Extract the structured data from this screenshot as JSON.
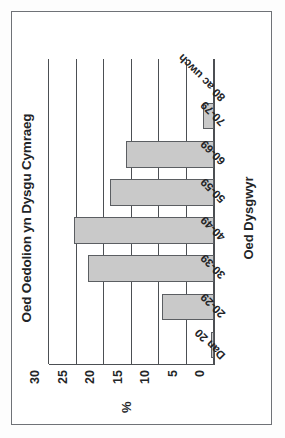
{
  "figure": {
    "frame_color": "#6f7277",
    "background": "#ffffff",
    "rotation_note": "chart printed landscape, scanned portrait"
  },
  "chart_data": {
    "type": "bar",
    "title": "Oed Oedolion yn Dysgu Cymraeg",
    "xlabel": "Oed Dysgwyr",
    "ylabel": "%",
    "categories": [
      "Dan 20",
      "20-29",
      "30-39",
      "40-49",
      "50-59",
      "60-69",
      "70-79",
      "80 ac uwch"
    ],
    "values": [
      0.5,
      9.5,
      23,
      25.5,
      19,
      16,
      2,
      0
    ],
    "ylim": [
      0,
      30
    ],
    "yticks": [
      0,
      5,
      10,
      15,
      20,
      25,
      30
    ],
    "ytick_labels": [
      "0",
      "5",
      "10",
      "15",
      "20",
      "25",
      "30"
    ],
    "grid": true,
    "legend": false,
    "bar_fill": "#c9c9c9",
    "bar_edge": "#5b5e62",
    "axis_color": "#4c4f53"
  }
}
